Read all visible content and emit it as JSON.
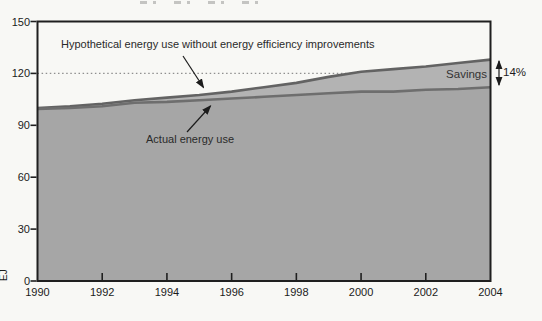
{
  "chart_data": {
    "type": "area",
    "title": "",
    "ylabel": "EJ",
    "ylim": [
      0,
      150
    ],
    "yticks": [
      0,
      30,
      60,
      90,
      120,
      150
    ],
    "xticks": [
      1990,
      1992,
      1994,
      1996,
      1998,
      2000,
      2002,
      2004
    ],
    "x": [
      1990,
      1991,
      1992,
      1993,
      1994,
      1995,
      1996,
      1997,
      1998,
      1999,
      2000,
      2001,
      2002,
      2003,
      2004
    ],
    "series": [
      {
        "name": "Hypothetical energy use without energy efficiency improvements",
        "values": [
          100,
          101,
          102.5,
          104.5,
          106,
          107.5,
          109.5,
          112,
          114.5,
          118,
          121,
          122.5,
          124,
          126,
          128
        ]
      },
      {
        "name": "Actual energy use",
        "values": [
          99.5,
          100,
          101,
          103,
          103.5,
          104.5,
          105.5,
          106.5,
          107.5,
          108.5,
          109.5,
          109.5,
          110.5,
          111,
          112
        ]
      }
    ],
    "reference_line": {
      "y": 120,
      "style": "dotted"
    },
    "legend_position": "none",
    "grid": false,
    "colors": {
      "actual_area_fill": "#a6a6a6",
      "savings_band_fill": "#b3b3b3",
      "hypothetical_line": "#636363",
      "actual_line": "#6e6e6e",
      "frame": "#1f1f1f",
      "reference_line": "#8f8f8f",
      "annotation_arrow": "#1c1c1c",
      "background": "#f8f8f5"
    }
  },
  "annotations": {
    "hypothetical_label": "Hypothetical energy use without energy efficiency improvements",
    "actual_label": "Actual energy use",
    "savings_label": "Savings",
    "savings_pct": "14%"
  }
}
